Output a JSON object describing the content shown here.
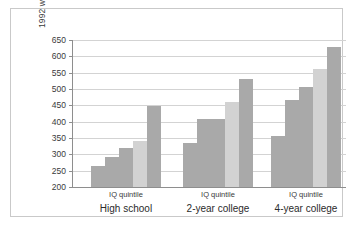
{
  "chart_data": {
    "type": "bar",
    "title": "",
    "subtitle": "",
    "xlabel": "",
    "ylabel": "1992 weekly wages",
    "ylim": [
      200,
      650
    ],
    "yticks": [
      200,
      250,
      300,
      350,
      400,
      450,
      500,
      550,
      600,
      650
    ],
    "grid": true,
    "legend": "none",
    "categories": [
      "High school",
      "2-year college",
      "4-year college"
    ],
    "group_axis_label": "IQ quintile",
    "series_note": "Five IQ quintile bars per education group (lowest to highest quintile)",
    "groups": [
      {
        "name": "High school",
        "axis_label": "IQ quintile",
        "values": [
          263,
          293,
          320,
          340,
          448
        ],
        "bar_colors": [
          "#a9a9a9",
          "#a9a9a9",
          "#a9a9a9",
          "#d2d2d2",
          "#a9a9a9"
        ]
      },
      {
        "name": "2-year college",
        "axis_label": "IQ quintile",
        "values": [
          335,
          408,
          409,
          460,
          532
        ],
        "bar_colors": [
          "#a9a9a9",
          "#a9a9a9",
          "#a9a9a9",
          "#d2d2d2",
          "#a9a9a9"
        ]
      },
      {
        "name": "4-year college",
        "axis_label": "IQ quintile",
        "values": [
          357,
          465,
          505,
          562,
          630
        ],
        "bar_colors": [
          "#a9a9a9",
          "#a9a9a9",
          "#a9a9a9",
          "#d2d2d2",
          "#a9a9a9"
        ]
      }
    ],
    "colors": {
      "bar_dark": "#a9a9a9",
      "bar_light": "#d2d2d2",
      "gridline": "#d3d3d3",
      "axis": "#8e8e8e",
      "frame": "#c9c9c9",
      "text": "#3a3a3a",
      "background": "#ffffff"
    }
  }
}
